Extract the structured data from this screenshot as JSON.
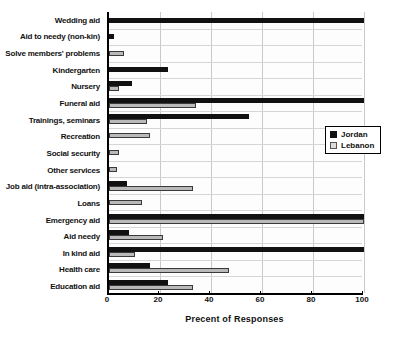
{
  "chart_data": {
    "type": "bar",
    "orientation": "horizontal",
    "title": "",
    "xlabel": "Precent of Responses",
    "ylabel": "",
    "xlim": [
      0,
      100
    ],
    "xticks": [
      0,
      20,
      40,
      60,
      80,
      100
    ],
    "grid": true,
    "legend_position": "middle-right",
    "categories": [
      "Wedding aid",
      "Aid to needy (non-kin)",
      "Solve members' problems",
      "Kindergarten",
      "Nursery",
      "Funeral aid",
      "Trainings, seminars",
      "Recreation",
      "Social security",
      "Other services",
      "Job aid (intra-association)",
      "Loans",
      "Emergency aid",
      "Aid needy",
      "In kind aid",
      "Health care",
      "Education aid"
    ],
    "series": [
      {
        "name": "Jordan",
        "color": "#111111",
        "values": [
          100,
          2,
          0,
          23,
          9,
          100,
          55,
          0,
          0,
          0,
          7,
          0,
          100,
          8,
          100,
          16,
          23
        ]
      },
      {
        "name": "Lebanon",
        "color": "#b9b9b9",
        "values": [
          0,
          0,
          6,
          0,
          4,
          34,
          15,
          16,
          4,
          3,
          33,
          13,
          100,
          21,
          10,
          47,
          33
        ]
      }
    ]
  },
  "legend": {
    "items": [
      {
        "label": "Jordan",
        "swatch": "jordan"
      },
      {
        "label": "Lebanon",
        "swatch": "lebanon"
      }
    ]
  }
}
